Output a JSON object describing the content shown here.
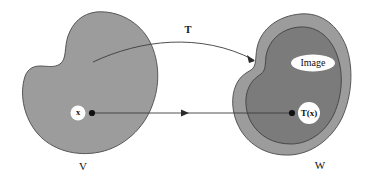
{
  "figure": {
    "type": "set-mapping-diagram",
    "background_color": "#ffffff"
  },
  "domain_set": {
    "label": "V",
    "fill_color": "#9c9c9c",
    "outline_color": "#4a4a4a",
    "point": {
      "label": "x",
      "halo_color": "#ffffff",
      "dot_color": "#111111"
    }
  },
  "codomain_set": {
    "label": "W",
    "fill_color": "#9c9c9c",
    "outline_color": "#4a4a4a",
    "inner_set": {
      "label": "Image",
      "fill_color": "#7b7b7b",
      "outline_color": "#3f3f3f",
      "halo_color": "#ffffff"
    },
    "point": {
      "label": "T(x)",
      "halo_color": "#ffffff",
      "dot_color": "#111111"
    }
  },
  "mappings": {
    "set_map": {
      "label": "T",
      "stroke_color": "#3c3c3c",
      "style": "curved-arrow"
    },
    "point_map": {
      "label": "",
      "stroke_color": "#3c3c3c",
      "style": "straight-arrow"
    }
  }
}
